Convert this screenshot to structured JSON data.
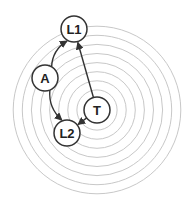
{
  "diagram": {
    "center": {
      "x": 97,
      "y": 110
    },
    "rings": {
      "count": 9,
      "inner_radius": 11,
      "spacing": 9.1,
      "color": "#c8c8c8"
    },
    "nodes": [
      {
        "id": "L1",
        "label": "L1",
        "x": 74,
        "y": 29
      },
      {
        "id": "A",
        "label": "A",
        "x": 45,
        "y": 78
      },
      {
        "id": "T",
        "label": "T",
        "x": 97,
        "y": 110
      },
      {
        "id": "L2",
        "label": "L2",
        "x": 67,
        "y": 133
      }
    ],
    "edges": [
      {
        "from": "A",
        "to": "L1",
        "curved": true
      },
      {
        "from": "A",
        "to": "L2",
        "curved": true
      },
      {
        "from": "T",
        "to": "L1",
        "curved": false
      },
      {
        "from": "T",
        "to": "L2",
        "curved": false
      }
    ],
    "node_radius": 13,
    "stroke_color": "#333333"
  }
}
